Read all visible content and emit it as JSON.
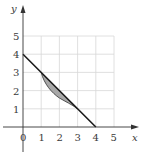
{
  "diagram": {
    "type": "coordinate-plane-region",
    "axes": {
      "x_label": "x",
      "y_label": "y",
      "x_ticks": [
        "0",
        "1",
        "2",
        "3",
        "4",
        "5"
      ],
      "y_ticks": [
        "1",
        "2",
        "3",
        "4",
        "5"
      ]
    },
    "grid": {
      "x_range": [
        0,
        5
      ],
      "y_range": [
        0,
        5
      ],
      "color": "#d8d8d8"
    },
    "line": {
      "description": "straight line from (0,4) to (4,0)",
      "points": [
        [
          0,
          4
        ],
        [
          4,
          0
        ]
      ],
      "color": "#1a1a1a"
    },
    "curve": {
      "description": "curve below the line from (1,3) to (3,1)",
      "points": [
        [
          1,
          3
        ],
        [
          1.5,
          2
        ],
        [
          2,
          1.5
        ],
        [
          3,
          1
        ]
      ]
    },
    "shaded_region": {
      "description": "region between line and curve for 1 ≤ x ≤ 3",
      "fill": "#a8a8a8"
    }
  }
}
